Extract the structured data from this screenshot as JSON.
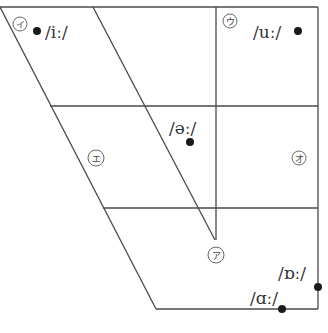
{
  "markers": [
    {
      "id": "i",
      "kana": "イ",
      "ipa": "/iː/"
    },
    {
      "id": "u",
      "kana": "ウ",
      "ipa": "/uː/"
    },
    {
      "id": "e",
      "kana": "エ"
    },
    {
      "id": "er",
      "ipa": "/əː/"
    },
    {
      "id": "o",
      "kana": "オ"
    },
    {
      "id": "a",
      "kana": "ア",
      "ipa": "/ɑː/"
    },
    {
      "id": "oo",
      "ipa": "/ɒː/"
    }
  ],
  "colors": {
    "line": "#4a4a4a",
    "dot": "#1a1a1a",
    "text": "#333333"
  }
}
